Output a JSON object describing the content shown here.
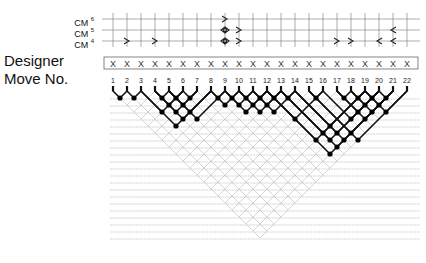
{
  "labels": {
    "cm_rows": [
      {
        "text": "CM",
        "sup": "6"
      },
      {
        "text": "CM",
        "sup": "5"
      },
      {
        "text": "CM",
        "sup": "4"
      }
    ],
    "designer": "Designer",
    "move_no": "Move No."
  },
  "moves": [
    "1",
    "2",
    "3",
    "4",
    "5",
    "6",
    "7",
    "8",
    "9",
    "10",
    "11",
    "12",
    "13",
    "14",
    "15",
    "16",
    "17",
    "18",
    "19",
    "20",
    "21",
    "22"
  ],
  "designer_marks": [
    "X",
    "X",
    "X",
    "X",
    "X",
    "X",
    "X",
    "X",
    "X",
    "X",
    "X",
    "X",
    "X",
    "X",
    "X",
    "X",
    "X",
    "X",
    "X",
    "X",
    "X",
    "X"
  ],
  "cm_marks": [
    {
      "row": "CM4",
      "col": 2,
      "glyph": "right"
    },
    {
      "row": "CM4",
      "col": 4,
      "glyph": "right"
    },
    {
      "row": "CM6",
      "col": 9,
      "glyph": "right"
    },
    {
      "row": "CM5",
      "col": 9,
      "glyph": "diamond"
    },
    {
      "row": "CM4",
      "col": 9,
      "glyph": "diamond"
    },
    {
      "row": "CM5",
      "col": 10,
      "glyph": "right"
    },
    {
      "row": "CM4",
      "col": 10,
      "glyph": "right"
    },
    {
      "row": "CM4",
      "col": 17,
      "glyph": "right"
    },
    {
      "row": "CM4",
      "col": 18,
      "glyph": "right"
    },
    {
      "row": "CM4",
      "col": 20,
      "glyph": "left"
    },
    {
      "row": "CM5",
      "col": 21,
      "glyph": "left"
    },
    {
      "row": "CM4",
      "col": 21,
      "glyph": "left"
    }
  ],
  "merges": [
    [
      1,
      2
    ],
    [
      2,
      3
    ],
    [
      4,
      5
    ],
    [
      5,
      6
    ],
    [
      6,
      7
    ],
    [
      8,
      9
    ],
    [
      9,
      10
    ],
    [
      10,
      11
    ],
    [
      11,
      12
    ],
    [
      12,
      13
    ],
    [
      13,
      14
    ],
    [
      15,
      16
    ],
    [
      17,
      18
    ],
    [
      18,
      19
    ],
    [
      19,
      20
    ],
    [
      20,
      21
    ],
    [
      3,
      6
    ],
    [
      4,
      6
    ],
    [
      5,
      7
    ],
    [
      8,
      10
    ],
    [
      9,
      11
    ],
    [
      10,
      12
    ],
    [
      11,
      13
    ],
    [
      18,
      20
    ],
    [
      19,
      21
    ],
    [
      4,
      7
    ],
    [
      5,
      8
    ],
    [
      9,
      12
    ],
    [
      10,
      13
    ],
    [
      18,
      21
    ],
    [
      17,
      20
    ],
    [
      19,
      22
    ],
    [
      4,
      8
    ],
    [
      5,
      9
    ],
    [
      11,
      14
    ],
    [
      17,
      21
    ],
    [
      16,
      20
    ],
    [
      3,
      8
    ],
    [
      14,
      19
    ],
    [
      12,
      16
    ],
    [
      15,
      21
    ],
    [
      13,
      19
    ],
    [
      14,
      20
    ],
    [
      12,
      19
    ],
    [
      13,
      20
    ],
    [
      14,
      21
    ],
    [
      15,
      22
    ],
    [
      13,
      21
    ],
    [
      12,
      21
    ]
  ]
}
